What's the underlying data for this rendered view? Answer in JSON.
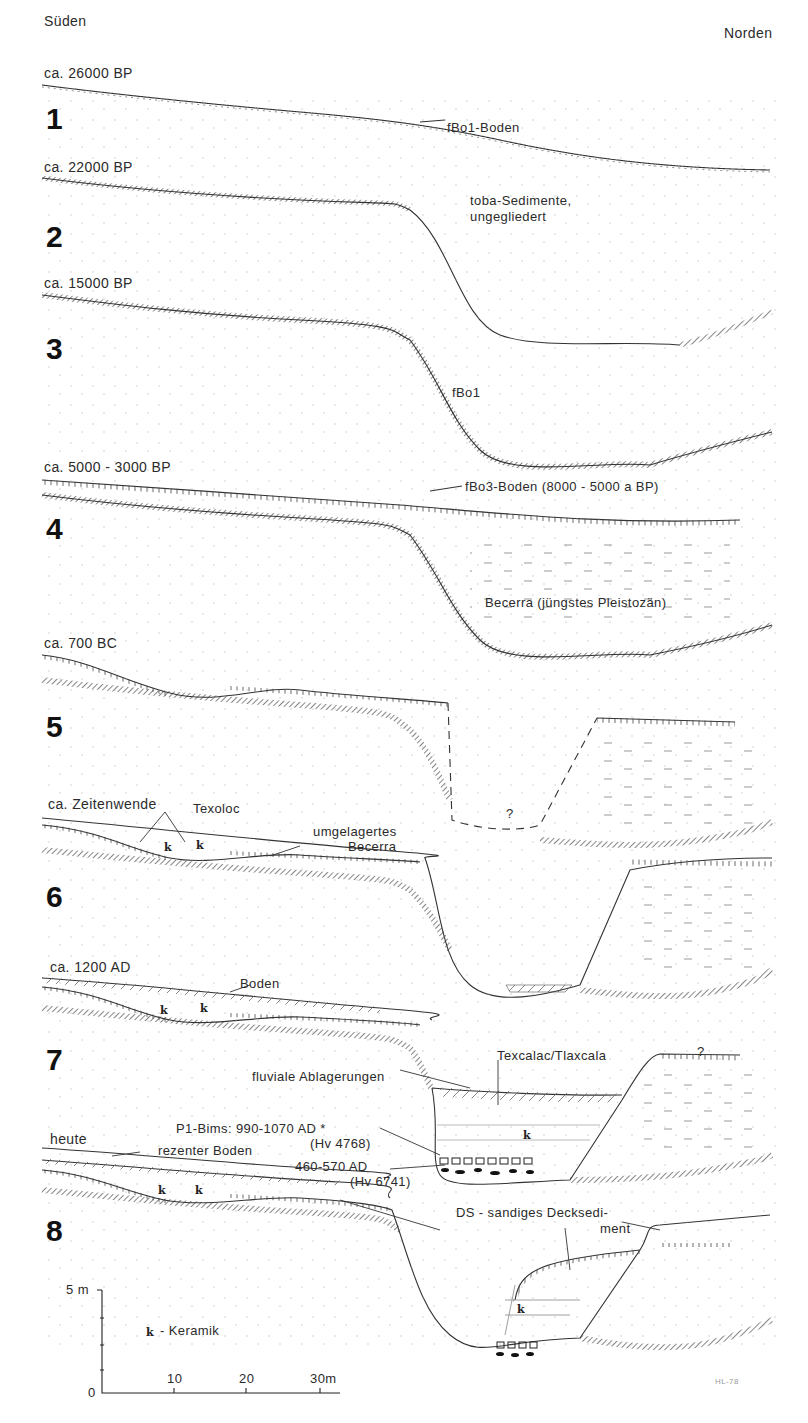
{
  "orientation": {
    "left": "Süden",
    "right": "Norden"
  },
  "stages": [
    {
      "number": "1",
      "date": "ca. 26000 BP"
    },
    {
      "number": "2",
      "date": "ca. 22000 BP"
    },
    {
      "number": "3",
      "date": "ca. 15000 BP"
    },
    {
      "number": "4",
      "date": "ca. 5000 - 3000 BP"
    },
    {
      "number": "5",
      "date": "ca. 700 BC"
    },
    {
      "number": "6",
      "date": "ca. Zeitenwende"
    },
    {
      "number": "7",
      "date": "ca. 1200 AD"
    },
    {
      "number": "8",
      "date": "heute"
    }
  ],
  "annotations": {
    "fbo1_boden": "fBo1-Boden",
    "toba_line1": "toba-Sedimente,",
    "toba_line2": "ungegliedert",
    "fbo1": "fBo1",
    "fbo3": "fBo3-Boden (8000 - 5000 a BP)",
    "becerra": "Becerra (jüngstes Pleistozän)",
    "question": "?",
    "texoloc": "Texoloc",
    "umgelagertes_line1": "umgelagertes",
    "umgelagertes_line2": "Becerra",
    "boden": "Boden",
    "texcalac": "Texcalac/Tlaxcala",
    "fluviale": "fluviale Ablagerungen",
    "p1_bims": "P1-Bims: 990-1070 AD *",
    "hv4768": "(Hv 4768)",
    "ad460": "460-570 AD",
    "hv6741": "(Hv 6741)",
    "rezenter": "rezenter Boden",
    "ds_line1": "DS - sandiges Decksedi-",
    "ds_line2": "ment",
    "k": "k"
  },
  "legend": {
    "k_symbol": "k",
    "k_label": "- Keramik"
  },
  "scale": {
    "vertical_top": "5 m",
    "vertical_bottom": "0",
    "horizontal_ticks": [
      "10",
      "20",
      "30m"
    ]
  },
  "signature": "HL-78"
}
